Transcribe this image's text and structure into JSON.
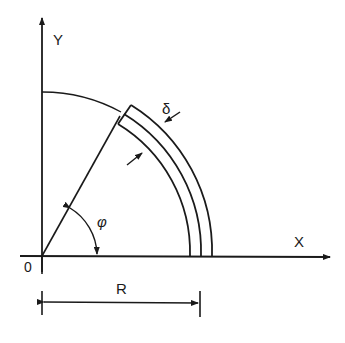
{
  "diagram": {
    "type": "engineering-sketch",
    "labels": {
      "y_axis": "Y",
      "x_axis": "X",
      "origin": "0",
      "thickness": "δ",
      "angle": "φ",
      "radius": "R"
    },
    "colors": {
      "ink": "#1a1a1a",
      "background": "#ffffff"
    }
  }
}
